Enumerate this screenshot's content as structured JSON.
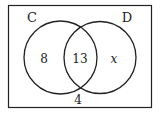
{
  "diagram": {
    "type": "venn",
    "sets": [
      {
        "label": "C",
        "only_value": "8"
      },
      {
        "label": "D",
        "only_value": "x"
      }
    ],
    "intersection_value": "13",
    "outside_value": "4"
  }
}
